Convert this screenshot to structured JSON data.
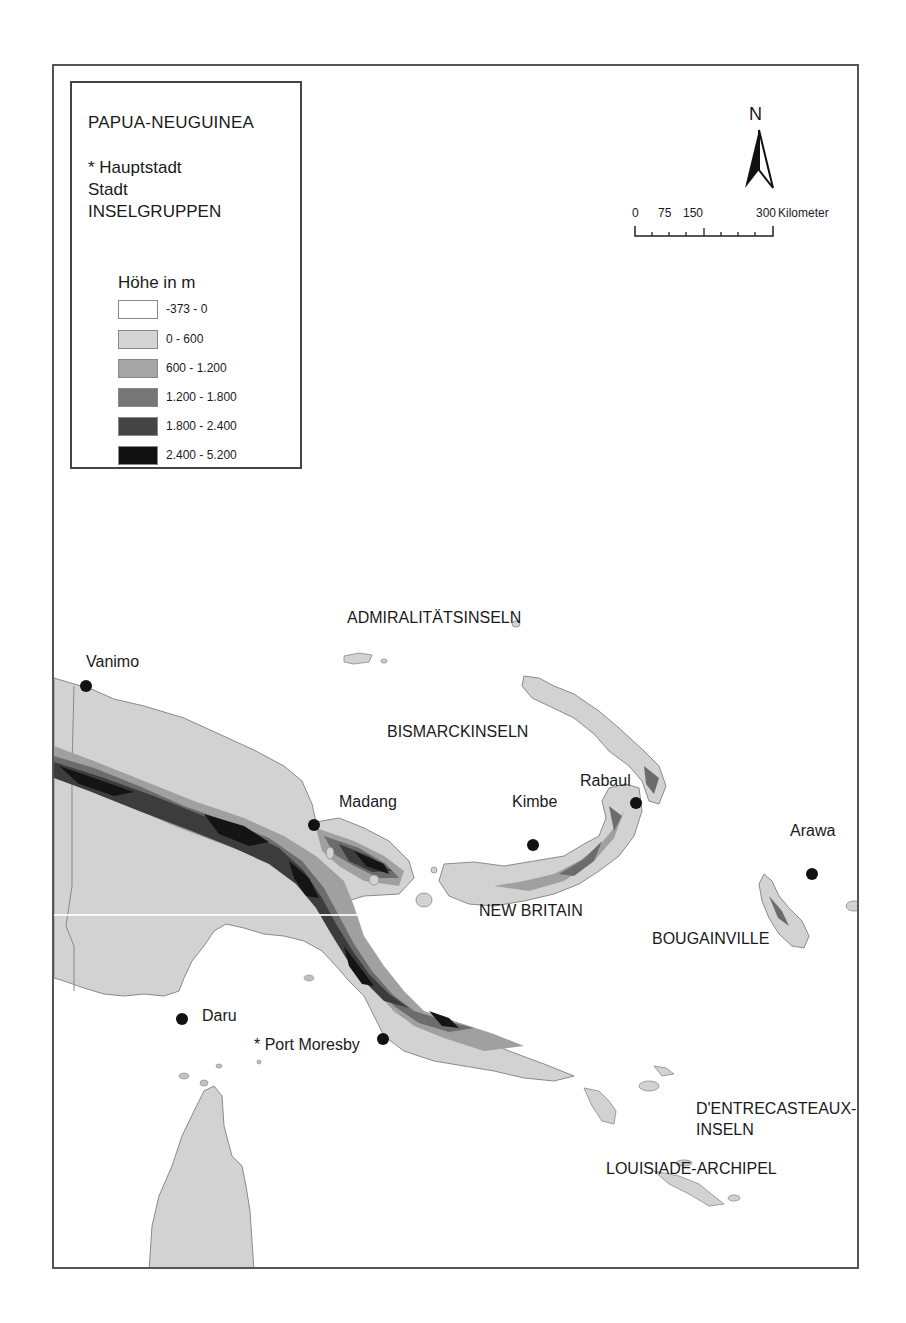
{
  "legend": {
    "title": "PAPUA-NEUGUINEA",
    "symbols": [
      {
        "label": "* Hauptstadt"
      },
      {
        "label": "Stadt"
      },
      {
        "label": "INSELGRUPPEN"
      }
    ],
    "elevation_title": "Höhe in m",
    "classes": [
      {
        "label": "-373 - 0",
        "color": "#ffffff"
      },
      {
        "label": "0 - 600",
        "color": "#d4d4d4"
      },
      {
        "label": "600 - 1.200",
        "color": "#a6a6a6"
      },
      {
        "label": "1.200 - 1.800",
        "color": "#767676"
      },
      {
        "label": "1.800 - 2.400",
        "color": "#444444"
      },
      {
        "label": "2.400 - 5.200",
        "color": "#111111"
      }
    ]
  },
  "north_arrow": {
    "label": "N"
  },
  "scale_bar": {
    "ticks": [
      "0",
      "75",
      "150",
      "300"
    ],
    "unit": "Kilometer"
  },
  "cities": [
    {
      "name": "Vanimo",
      "capital": false
    },
    {
      "name": "Madang",
      "capital": false
    },
    {
      "name": "Rabaul",
      "capital": false
    },
    {
      "name": "Kimbe",
      "capital": false
    },
    {
      "name": "Arawa",
      "capital": false
    },
    {
      "name": "Daru",
      "capital": false
    },
    {
      "name": "* Port Moresby",
      "capital": true
    }
  ],
  "island_groups": [
    {
      "name": "ADMIRALITÄTSINSELN"
    },
    {
      "name": "BISMARCKINSELN"
    },
    {
      "name": "NEW BRITAIN"
    },
    {
      "name": "BOUGAINVILLE"
    },
    {
      "name": "D'ENTRECASTEAUX-"
    },
    {
      "name": "INSELN"
    },
    {
      "name": "LOUISIADE-ARCHIPEL"
    }
  ],
  "colors": {
    "lowland": "#d2d2d2",
    "mid": "#a0a0a0",
    "high": "#6c6c6c",
    "higher": "#3c3c3c",
    "peak": "#141414",
    "coast": "#8a8a8a"
  }
}
